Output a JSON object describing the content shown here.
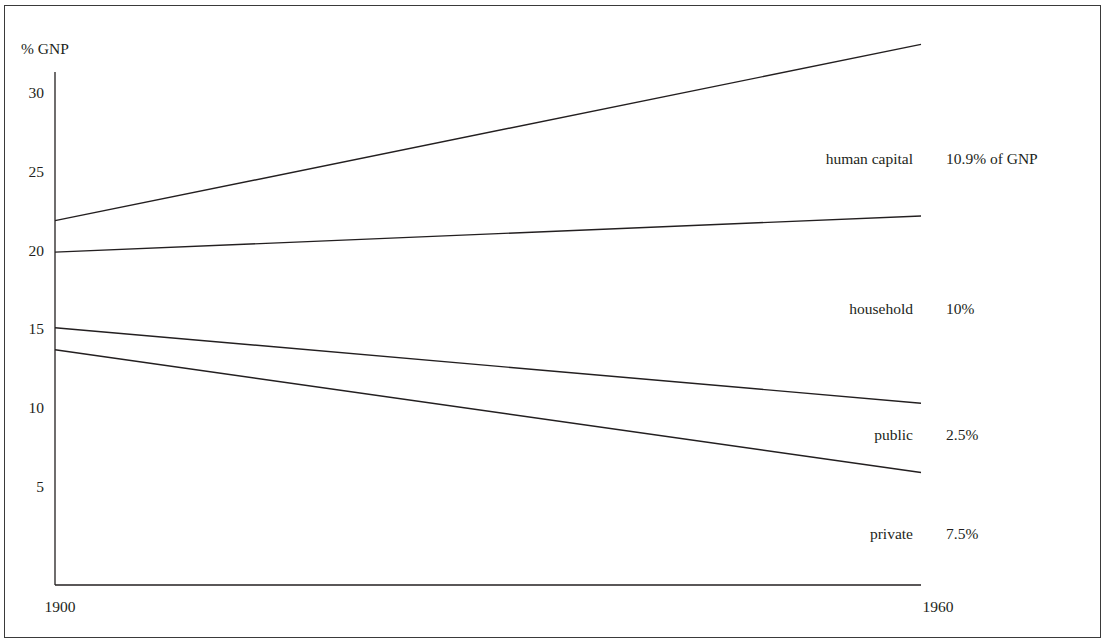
{
  "chart_data": {
    "type": "line",
    "title": "",
    "ylabel": "% GNP",
    "xlabel": "",
    "x": [
      1900,
      1960
    ],
    "xlim": [
      1900,
      1960
    ],
    "ylim": [
      -1.25,
      33
    ],
    "grid": false,
    "x_ticks": [
      {
        "value": 1900,
        "label": "1900"
      },
      {
        "value": 1960,
        "label": "1960"
      }
    ],
    "y_ticks": [
      {
        "value": 30,
        "label": "30"
      },
      {
        "value": 25,
        "label": "25"
      },
      {
        "value": 20,
        "label": "20"
      },
      {
        "value": 15,
        "label": "15"
      },
      {
        "value": 10,
        "label": "10"
      },
      {
        "value": 5,
        "label": "5"
      }
    ],
    "series": [
      {
        "name": "line-1",
        "values": [
          21.9,
          33.1
        ]
      },
      {
        "name": "line-2",
        "values": [
          19.9,
          22.2
        ]
      },
      {
        "name": "line-3",
        "values": [
          15.1,
          10.3
        ]
      },
      {
        "name": "line-4",
        "values": [
          13.7,
          5.9
        ]
      }
    ],
    "annotations": [
      {
        "label": "human capital",
        "value_text": "10.9% of GNP",
        "y": 25.8
      },
      {
        "label": "household",
        "value_text": "10%",
        "y": 16.3
      },
      {
        "label": "public",
        "value_text": "2.5%",
        "y": 8.3
      },
      {
        "label": "private",
        "value_text": "7.5%",
        "y": 2.0
      }
    ]
  }
}
